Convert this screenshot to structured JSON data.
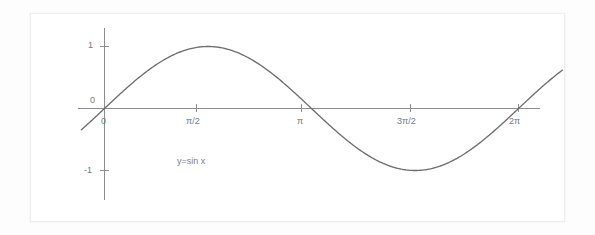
{
  "figure": {
    "background_color": "#ffffff",
    "frame_color": "#ededed",
    "curve_color": "#6e6e6e",
    "axis_color": "#8e8e8e",
    "label_color": "#777777"
  },
  "chart_data": {
    "type": "line",
    "title": "",
    "subtitle": "",
    "xlabel": "",
    "ylabel": "",
    "annotation": "y=sin x",
    "grid": false,
    "legend": null,
    "xlim": [
      -0.35,
      6.95
    ],
    "ylim": [
      -1.45,
      1.45
    ],
    "x_tick_labels": [
      "0",
      "π/2",
      "π",
      "3π/2",
      "2π"
    ],
    "x_tick_values": [
      0,
      1.5708,
      3.1416,
      4.7124,
      6.2832
    ],
    "y_tick_labels": [
      "1",
      "0",
      "-1"
    ],
    "y_tick_values": [
      1,
      0,
      -1
    ],
    "series": [
      {
        "name": "y=sin x",
        "expression": "y = sin x",
        "x": [
          -0.35,
          -0.2,
          0,
          0.3927,
          0.7854,
          1.1781,
          1.5708,
          1.9635,
          2.3562,
          2.7489,
          3.1416,
          3.5343,
          3.927,
          4.3197,
          4.7124,
          5.1051,
          5.4978,
          5.8905,
          6.2832,
          6.6759,
          6.95
        ],
        "y": [
          -0.3429,
          -0.1987,
          0,
          0.3827,
          0.7071,
          0.9239,
          1.0,
          0.9239,
          0.7071,
          0.3827,
          0,
          -0.3827,
          -0.7071,
          -0.9239,
          -1.0,
          -0.9239,
          -0.7071,
          -0.3827,
          0,
          0.3827,
          0.6119
        ]
      }
    ]
  },
  "labels": {
    "y_one": "1",
    "y_zero": "0",
    "y_neg_one": "-1",
    "x_zero": "0",
    "x_pi_over_2": "π/2",
    "x_pi": "π",
    "x_three_pi_over_2": "3π/2",
    "x_two_pi": "2π",
    "equation": "y=sin x"
  }
}
